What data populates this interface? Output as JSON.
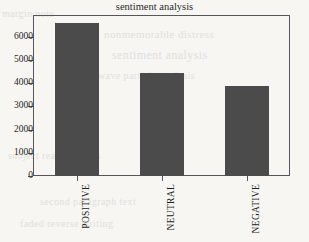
{
  "chart_data": {
    "type": "bar",
    "title": "sentiment analysis",
    "xlabel": "",
    "ylabel": "",
    "categories": [
      "POSITIVE",
      "NEUTRAL",
      "NEGATIVE"
    ],
    "values": [
      6600,
      4450,
      3900
    ],
    "ylim": [
      0,
      6900
    ],
    "yticks": [
      0,
      1000,
      2000,
      3000,
      4000,
      5000,
      6000
    ],
    "ytick_labels": [
      "0",
      "1000",
      "2000",
      "3000",
      "4000",
      "5000",
      "6000"
    ],
    "grid": false,
    "legend": null,
    "bar_color": "#4b4b4b",
    "axis_color": "#55565a",
    "background_color": "#f7f6f3",
    "xlabel_rotation": -90
  },
  "background_bleed": [
    "nonmemorable distress",
    "sentiment analysis",
    "wave particle analysis",
    "subject reading notes",
    "second paragraph text",
    "faded reverse writing",
    "margin note"
  ]
}
